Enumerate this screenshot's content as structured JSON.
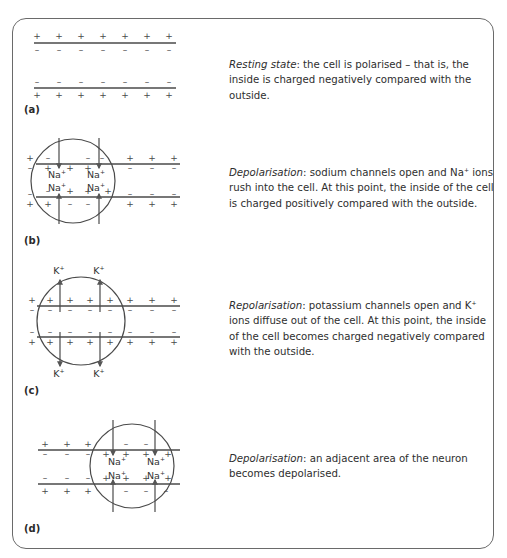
{
  "figure": {
    "panels": [
      {
        "id": "a",
        "label": "(a)",
        "title": "Resting state",
        "description": ": the cell is polarised – that is, the inside is charged negatively compared with the outside."
      },
      {
        "id": "b",
        "label": "(b)",
        "title": "Depolarisation",
        "description_parts": [
          ": sodium channels open and Na",
          "+",
          " ions rush into the cell. At this point, the inside of the cell is charged positively compared with the outside."
        ]
      },
      {
        "id": "c",
        "label": "(c)",
        "title": "Repolarisation",
        "description_parts": [
          ": potassium channels open and K",
          "+",
          " ions diffuse out of the cell. At this point, the inside of the cell becomes charged negatively compared with the outside."
        ]
      },
      {
        "id": "d",
        "label": "(d)",
        "title": "Depolarisation",
        "description": ": an adjacent area of the neuron becomes depolarised."
      }
    ],
    "ions": {
      "sodium": "Na",
      "potassium": "K",
      "charge": "+"
    },
    "symbols": {
      "plus": "+",
      "minus": "–"
    },
    "colors": {
      "line": "#4a4a4a",
      "text": "#2e2e2e",
      "border": "#6a6a6a"
    }
  }
}
